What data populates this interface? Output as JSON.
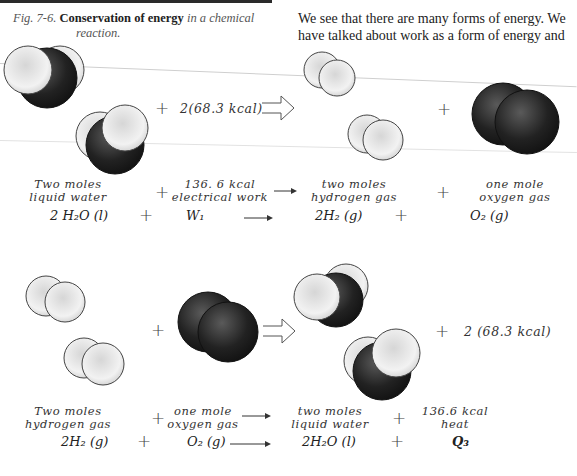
{
  "figure": {
    "label": "Fig. 7-6.",
    "title_bold": "Conservation of energy",
    "title_rest": "in a chemical",
    "title_line2": "reaction."
  },
  "body_text": {
    "line1": "We see that there are many forms of energy. We",
    "line2": "have talked about work as a form of energy and"
  },
  "reaction1": {
    "energy_input": "2(68.3 kcal)",
    "labels": {
      "reactant1_line1": "Two moles",
      "reactant1_line2": "liquid water",
      "reactant2_line1": "136. 6 kcal",
      "reactant2_line2": "electrical work",
      "product1_line1": "two moles",
      "product1_line2": "hydrogen gas",
      "product2_line1": "one mole",
      "product2_line2": "oxygen gas"
    },
    "equation": {
      "reactant1": "2 H₂O (l)",
      "reactant2": "W₁",
      "product1": "2H₂ (g)",
      "product2": "O₂ (g)"
    }
  },
  "reaction2": {
    "energy_output": "2 (68.3 kcal)",
    "labels": {
      "reactant1_line1": "Two moles",
      "reactant1_line2": "hydrogen gas",
      "reactant2_line1": "one mole",
      "reactant2_line2": "oxygen gas",
      "product1_line1": "two moles",
      "product1_line2": "liquid water",
      "product2_line1": "136.6 kcal",
      "product2_line2": "heat"
    },
    "equation": {
      "reactant1": "2H₂ (g)",
      "reactant2": "O₂ (g)",
      "product1": "2H₂O (l)",
      "product2": "Q₃"
    }
  },
  "symbols": {
    "plus": "+",
    "colors": {
      "ink": "#222222",
      "oxygen": "#1e1e1e",
      "hydrogen": "#e8e8e8"
    }
  }
}
